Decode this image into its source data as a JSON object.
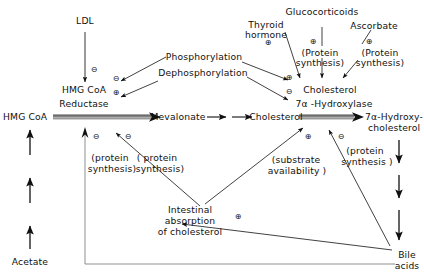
{
  "diagram": {
    "background_color": "#ffffff",
    "line_color": "#111111",
    "thick_arrow_color": "#8c8c8c"
  },
  "nodes": {
    "ldl": "LDL",
    "hmg_coa_reductase_line1": "HMG CoA",
    "hmg_coa_reductase_line2": "Reductase",
    "phosphorylation": "Phosphorylation",
    "dephosphorylation": "Dephosphorylation",
    "thyroid_hormone_line1": "Thyroid",
    "thyroid_hormone_line2": "hormone",
    "glucocorticoids": "Glucocorticoids",
    "ascorbate": "Ascorbate",
    "protein_synthesis_gluco_line1": "(Protein",
    "protein_synthesis_gluco_line2": "synthesis)",
    "protein_synthesis_asc_line1": "(Protein",
    "protein_synthesis_asc_line2": "synthesis)",
    "cholesterol_7a_hydroxylase_line1": "Cholesterol",
    "cholesterol_7a_hydroxylase_line2": "7α -Hydroxylase",
    "hmg_coa": "HMG CoA",
    "mevalonate": "Mevalonate",
    "cholesterol": "Cholesterol",
    "hydroxycholesterol_line1": "7α-Hydroxy-",
    "hydroxycholesterol_line2": "cholesterol",
    "acetate": "Acetate",
    "bile_acids_line1": "Bile",
    "bile_acids_line2": "acids",
    "intestinal_absorption_line1": "Intestinal",
    "intestinal_absorption_line2": "absorption",
    "intestinal_absorption_line3": "of cholesterol"
  },
  "annotations": {
    "protein_synthesis_left_line1": "(protein",
    "protein_synthesis_left_line2": "synthesis)",
    "protein_synthesis_mid_line1": "( protein",
    "protein_synthesis_mid_line2": "synthesis)",
    "substrate_availability_line1": "(substrate",
    "substrate_availability_line2": "availability )",
    "protein_synthesis_right_line1": "(protein",
    "protein_synthesis_right_line2": "synthesis )"
  },
  "symbols": {
    "minus": "⊖",
    "plus": "⊕",
    "ldl_inhibits_reductase": "⊖",
    "phosphorylation_inhibits": "⊖",
    "dephosphorylation_activates": "⊕",
    "thyroid_activates": "⊕",
    "glucocorticoids_activate": "⊕",
    "ascorbate_activates": "⊕",
    "phospho_activates_hydroxylase": "⊕",
    "dephospho_inhibits_hydroxylase": "⊖",
    "bile_acids_inhibit_hmg": "⊖",
    "intestinal_inhibits_mevalonate": "⊖",
    "intestinal_activates_cholesterol": "⊕",
    "bile_acids_inhibit_hydroxylase": "⊖",
    "bile_acids_activate_intestinal": "⊕"
  }
}
